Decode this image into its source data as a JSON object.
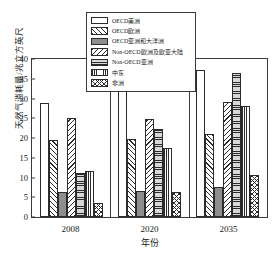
{
  "chart_data": {
    "type": "bar",
    "title": "",
    "xlabel": "年份",
    "ylabel": "天然气消耗量/兆立方英尺",
    "categories": [
      "2008",
      "2020",
      "2035"
    ],
    "ylim": [
      0,
      40
    ],
    "yticks": [
      0,
      5,
      10,
      15,
      20,
      25,
      30,
      35,
      40
    ],
    "ytick_labels": [
      "0",
      "5",
      "10",
      "15",
      "20",
      "25",
      "30",
      "35",
      "40"
    ],
    "grid": false,
    "legend_position": "top-center",
    "series": [
      {
        "name": "OECD美洲",
        "pattern": "empty",
        "values": [
          28.8,
          32.2,
          37.2
        ]
      },
      {
        "name": "OECD欧洲",
        "pattern": "diagonal-up",
        "values": [
          19.5,
          19.8,
          21.0
        ]
      },
      {
        "name": "OECD亚洲和大洋洲",
        "pattern": "solid-gray",
        "values": [
          6.3,
          6.5,
          7.6
        ]
      },
      {
        "name": "Non-OECD欧洲及欧亚大陆",
        "pattern": "diagonal-down",
        "values": [
          25.1,
          24.7,
          29.0
        ]
      },
      {
        "name": "Non-OECD亚洲",
        "pattern": "horizontal-lines",
        "values": [
          11.2,
          22.2,
          36.4
        ]
      },
      {
        "name": "中东",
        "pattern": "vertical-lines",
        "values": [
          11.7,
          17.5,
          28.0
        ]
      },
      {
        "name": "非洲",
        "pattern": "crosshatch",
        "values": [
          3.6,
          6.4,
          10.7
        ]
      }
    ]
  }
}
